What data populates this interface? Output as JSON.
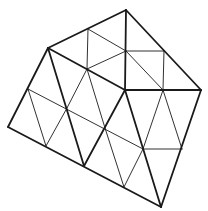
{
  "figure": {
    "width": 208,
    "height": 211,
    "background": "#ffffff",
    "stroke_color": "#1a1a1a",
    "thick_width": 1.8,
    "thin_width": 0.9
  },
  "vertices": {
    "top": [
      126,
      10
    ],
    "upper_left": [
      48,
      48
    ],
    "right": [
      201,
      90
    ],
    "bottom": [
      161,
      207
    ],
    "left": [
      8,
      127
    ],
    "top_edge_mid": [
      88,
      29
    ],
    "upper_center": [
      126,
      51
    ],
    "upper_right_inner": [
      164,
      51
    ],
    "upper_left_inner": [
      87,
      69
    ],
    "center": [
      125,
      90
    ],
    "right_mid": [
      163,
      90
    ],
    "left_edge_mid": [
      28,
      89
    ],
    "mid_left": [
      67,
      108
    ],
    "mid_center": [
      105,
      128
    ],
    "lower_center": [
      143,
      149
    ],
    "lower_right": [
      182,
      149
    ],
    "bottom_edge_a": [
      46,
      146
    ],
    "bottom_edge_b": [
      84,
      166
    ],
    "bottom_edge_c": [
      124,
      187
    ]
  },
  "thick_lines": [
    [
      126,
      10,
      48,
      48
    ],
    [
      126,
      10,
      201,
      90
    ],
    [
      201,
      90,
      161,
      207
    ],
    [
      161,
      207,
      8,
      127
    ],
    [
      8,
      127,
      48,
      48
    ],
    [
      126,
      10,
      125,
      90
    ],
    [
      125,
      90,
      201,
      90
    ],
    [
      48,
      48,
      125,
      90
    ],
    [
      48,
      48,
      84,
      166
    ],
    [
      125,
      90,
      84,
      166
    ],
    [
      125,
      90,
      161,
      207
    ]
  ],
  "thin_lines": [
    [
      88,
      29,
      87,
      69
    ],
    [
      88,
      29,
      126,
      51
    ],
    [
      87,
      69,
      126,
      51
    ],
    [
      126,
      51,
      164,
      51
    ],
    [
      164,
      51,
      163,
      90
    ],
    [
      126,
      51,
      163,
      90
    ],
    [
      28,
      89,
      143,
      149
    ],
    [
      28,
      89,
      46,
      146
    ],
    [
      67,
      108,
      46,
      146
    ],
    [
      87,
      69,
      67,
      108
    ],
    [
      87,
      69,
      105,
      128
    ],
    [
      105,
      128,
      124,
      187
    ],
    [
      143,
      149,
      124,
      187
    ],
    [
      163,
      90,
      143,
      149
    ],
    [
      163,
      90,
      182,
      149
    ],
    [
      143,
      149,
      182,
      149
    ]
  ]
}
